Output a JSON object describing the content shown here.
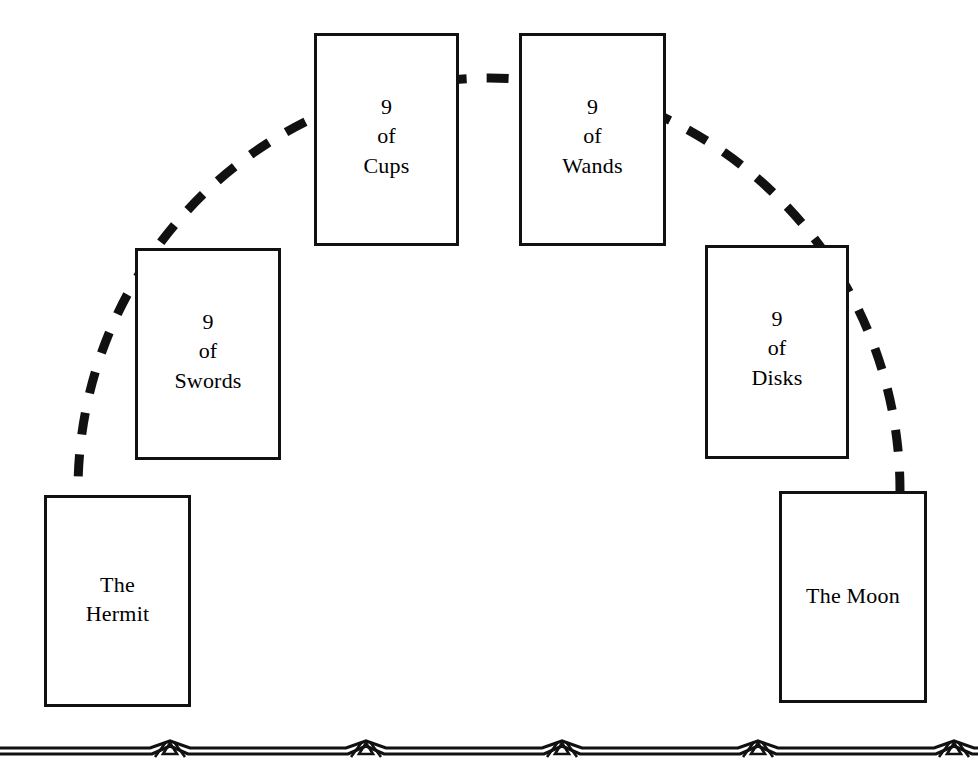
{
  "diagram": {
    "background_color": "#ffffff",
    "ink_color": "#111111",
    "layout": "arc",
    "connector_style": "dashed-arc"
  },
  "cards": [
    {
      "id": "hermit",
      "name": "The Hermit",
      "lines": [
        "The",
        "Hermit"
      ],
      "position": "arc-left-end"
    },
    {
      "id": "swords",
      "name": "9 of Swords",
      "lines": [
        "9",
        "of",
        "Swords"
      ],
      "position": "arc-left-mid"
    },
    {
      "id": "cups",
      "name": "9 of Cups",
      "lines": [
        "9",
        "of",
        "Cups"
      ],
      "position": "arc-top-left"
    },
    {
      "id": "wands",
      "name": "9 of Wands",
      "lines": [
        "9",
        "of",
        "Wands"
      ],
      "position": "arc-top-right"
    },
    {
      "id": "disks",
      "name": "9 of Disks",
      "lines": [
        "9",
        "of",
        "Disks"
      ],
      "position": "arc-right-mid"
    },
    {
      "id": "moon",
      "name": "The Moon",
      "lines": [
        "The Moon"
      ],
      "position": "arc-right-end"
    }
  ],
  "ornament": {
    "name": "chevron-diamond-border",
    "repeat_count": 5,
    "color": "#111111"
  }
}
